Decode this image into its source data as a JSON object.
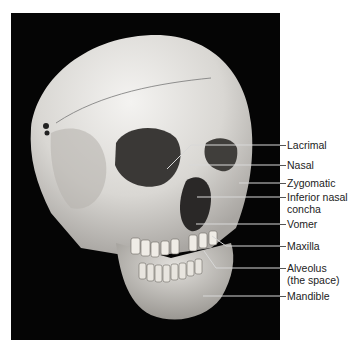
{
  "figure": {
    "labels": [
      {
        "id": "lacrimal",
        "text": "Lacrimal",
        "y": 145
      },
      {
        "id": "nasal",
        "text": "Nasal",
        "y": 165
      },
      {
        "id": "zygomatic",
        "text": "Zygomatic",
        "y": 183
      },
      {
        "id": "inferior-nasal-concha",
        "text": "Inferior nasal",
        "text2": "concha",
        "y": 197
      },
      {
        "id": "vomer",
        "text": "Vomer",
        "y": 224
      },
      {
        "id": "maxilla",
        "text": "Maxilla",
        "y": 245
      },
      {
        "id": "alveolus",
        "text": "Alveolus",
        "text2": "(the space)",
        "y": 268
      },
      {
        "id": "mandible",
        "text": "Mandible",
        "y": 296
      }
    ]
  },
  "colors": {
    "background": "#050505",
    "bone": "#e6e4e0",
    "leader": "#d8d8d8",
    "text": "#222222"
  }
}
